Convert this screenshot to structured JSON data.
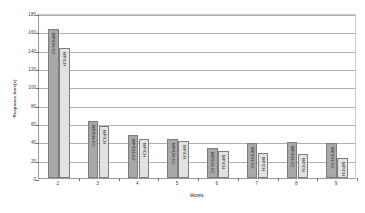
{
  "chart_data": {
    "type": "bar",
    "title": "",
    "xlabel": "Hosts",
    "ylabel": "Response time(s)",
    "categories": [
      "2",
      "3",
      "4",
      "5",
      "6",
      "7",
      "8",
      "9"
    ],
    "ylim": [
      0,
      180
    ],
    "yticks": [
      0,
      20,
      40,
      60,
      80,
      100,
      120,
      140,
      160,
      180
    ],
    "grid": true,
    "legend": "none",
    "series": [
      {
        "name": "MPICH-G2",
        "color": "#a8a8a8",
        "values": [
          163,
          62,
          47,
          43,
          33,
          38,
          39,
          38
        ]
      },
      {
        "name": "MPICH",
        "color": "#e2e2e2",
        "values": [
          142,
          57,
          43,
          40,
          30,
          27,
          26,
          22
        ]
      }
    ]
  }
}
